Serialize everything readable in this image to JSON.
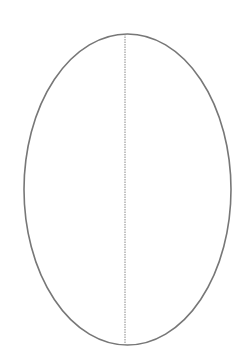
{
  "diagram": {
    "type": "ellipse-with-vertical-axis",
    "ellipse": {
      "cx": 127.5,
      "cy": 189.5,
      "rx": 103.5,
      "ry": 155.5,
      "stroke": "#777777",
      "stroke_width": 1.6
    },
    "axis": {
      "x": 125,
      "y1": 34,
      "y2": 345,
      "stroke": "#888888",
      "stroke_width": 1,
      "dash": "1.5 1"
    }
  }
}
